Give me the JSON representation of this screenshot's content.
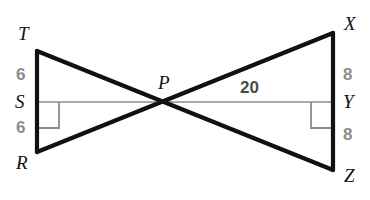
{
  "figure": {
    "kind": "geometry-diagram",
    "background_color": "#ffffff",
    "stroke_color": "#111111",
    "thin_stroke_color": "#8c8c8c",
    "label_color": "#111111",
    "measure_color": "#8c8c8c",
    "measure_dark_color": "#4a4a4a"
  },
  "vertices": [
    {
      "id": "T",
      "label": "T",
      "x": 37,
      "y": 51,
      "label_x": 18,
      "label_y": 24
    },
    {
      "id": "S",
      "label": "S",
      "x": 37,
      "y": 102,
      "label_x": 15,
      "label_y": 92
    },
    {
      "id": "R",
      "label": "R",
      "x": 37,
      "y": 152,
      "label_x": 16,
      "label_y": 153
    },
    {
      "id": "P",
      "label": "P",
      "x": 165,
      "y": 102,
      "label_x": 158,
      "label_y": 73
    },
    {
      "id": "X",
      "label": "X",
      "x": 333,
      "y": 33,
      "label_x": 344,
      "label_y": 14
    },
    {
      "id": "Y",
      "label": "Y",
      "x": 333,
      "y": 102,
      "label_x": 343,
      "label_y": 92
    },
    {
      "id": "Z",
      "label": "Z",
      "x": 333,
      "y": 170,
      "label_x": 344,
      "label_y": 166
    }
  ],
  "segments": [
    {
      "name": "segment-TR",
      "from": "T",
      "to": "R",
      "style": "thick"
    },
    {
      "name": "segment-XZ",
      "from": "X",
      "to": "Z",
      "style": "thick"
    },
    {
      "name": "segment-TZ",
      "from": "T",
      "to": "Z",
      "style": "thick"
    },
    {
      "name": "segment-RX",
      "from": "R",
      "to": "X",
      "style": "thick"
    },
    {
      "name": "segment-SY",
      "from": "S",
      "to": "Y",
      "style": "thin"
    }
  ],
  "right_angles": [
    {
      "name": "right-angle-S",
      "at": "S",
      "x": 37,
      "y": 102,
      "dx": 22,
      "dy": 26
    },
    {
      "name": "right-angle-Y",
      "at": "Y",
      "x": 333,
      "y": 102,
      "dx": -22,
      "dy": 26
    }
  ],
  "measures": [
    {
      "name": "measure-TS",
      "value": "6",
      "x": 16,
      "y": 66,
      "tone": "gray"
    },
    {
      "name": "measure-SR",
      "value": "6",
      "x": 16,
      "y": 119,
      "tone": "gray"
    },
    {
      "name": "measure-XY",
      "value": "8",
      "x": 343,
      "y": 66,
      "tone": "gray"
    },
    {
      "name": "measure-YZ",
      "value": "8",
      "x": 343,
      "y": 126,
      "tone": "gray"
    },
    {
      "name": "measure-PY",
      "value": "20",
      "x": 240,
      "y": 79,
      "tone": "dark"
    }
  ]
}
